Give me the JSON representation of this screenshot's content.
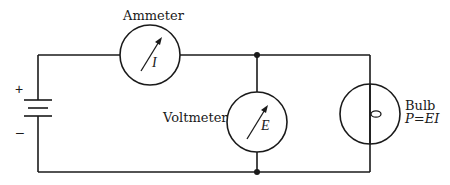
{
  "diagram": {
    "type": "circuit",
    "components": {
      "ammeter": {
        "label": "Ammeter",
        "symbol": "I"
      },
      "voltmeter": {
        "label": "Voltmeter",
        "symbol": "E"
      },
      "bulb": {
        "label": "Bulb",
        "formula": "P=EI"
      },
      "battery": {
        "positive": "+",
        "negative": "–"
      }
    },
    "colors": {
      "line": "#1a1a1a",
      "background": "#ffffff"
    }
  }
}
